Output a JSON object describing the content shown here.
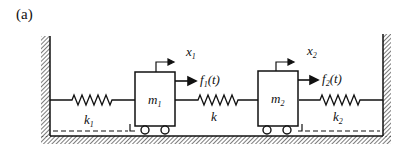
{
  "panel_label": "(a)",
  "masses": [
    {
      "name": "m",
      "sub": "1"
    },
    {
      "name": "m",
      "sub": "2"
    }
  ],
  "springs": [
    {
      "name": "k",
      "sub": "1"
    },
    {
      "name": "k",
      "sub": ""
    },
    {
      "name": "k",
      "sub": "2"
    }
  ],
  "displacements": [
    {
      "name": "x",
      "sub": "1"
    },
    {
      "name": "x",
      "sub": "2"
    }
  ],
  "forces": [
    {
      "name": "f",
      "sub": "1",
      "arg": "(t)"
    },
    {
      "name": "f",
      "sub": "2",
      "arg": "(t)"
    }
  ],
  "colors": {
    "line": "#111111",
    "background": "#ffffff"
  }
}
